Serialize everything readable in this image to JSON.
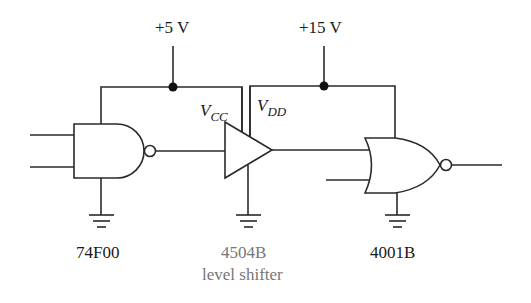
{
  "diagram": {
    "type": "logic level-shifting circuit",
    "supplies": [
      {
        "id": "vcc",
        "label": "+5 V"
      },
      {
        "id": "vdd",
        "label": "+15 V"
      }
    ],
    "pin_labels": {
      "vcc_main": "V",
      "vcc_sub": "CC",
      "vdd_main": "V",
      "vdd_sub": "DD"
    },
    "components": [
      {
        "id": "nand",
        "kind": "NAND gate",
        "label": "74F00"
      },
      {
        "id": "buffer",
        "kind": "buffer / level shifter",
        "label": "4504B",
        "sublabel": "level shifter"
      },
      {
        "id": "nor",
        "kind": "NOR gate",
        "label": "4001B"
      }
    ],
    "colors": {
      "line": "#2a2a2a",
      "text": "#1a1a1a",
      "muted_text": "#777777",
      "background": "#ffffff"
    }
  }
}
